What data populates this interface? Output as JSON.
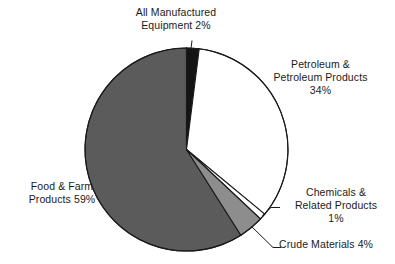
{
  "chart_data": {
    "type": "pie",
    "title": "",
    "subtitle": "",
    "xlabel": "",
    "ylabel": "",
    "legend_position": "none",
    "grid": false,
    "start_angle_deg": -90,
    "direction": "clockwise",
    "categories": [
      "All Manufactured Equipment",
      "Petroleum & Petroleum Products",
      "Chemicals & Related Products",
      "Crude Materials",
      "Food & Farm Products"
    ],
    "values": [
      2,
      34,
      1,
      4,
      59
    ],
    "units": "percent",
    "slices": [
      {
        "name": "All Manufactured Equipment",
        "value": 2,
        "value_label": "2%",
        "color": "#141414",
        "label_text": "All Manufactured\nEquipment 2%",
        "label_placement": "outside-top",
        "leader_line": true
      },
      {
        "name": "Petroleum & Petroleum Products",
        "value": 34,
        "value_label": "34%",
        "color": "#ffffff",
        "label_text": "Petroleum &\nPetroleum Products\n34%",
        "label_placement": "outside-right",
        "leader_line": false
      },
      {
        "name": "Chemicals & Related Products",
        "value": 1,
        "value_label": "1%",
        "color": "#ffffff",
        "label_text": "Chemicals &\nRelated Products\n1%",
        "label_placement": "outside-right-lower",
        "leader_line": true
      },
      {
        "name": "Crude Materials",
        "value": 4,
        "value_label": "4%",
        "color": "#8d8d8d",
        "label_text": "Crude Materials 4%",
        "label_placement": "outside-bottom-right",
        "leader_line": true
      },
      {
        "name": "Food & Farm Products",
        "value": 59,
        "value_label": "59%",
        "color": "#5b5b5b",
        "label_text": "Food & Farm\nProducts 59%",
        "label_placement": "outside-left",
        "leader_line": false
      }
    ],
    "colors": {
      "manufactured": "#141414",
      "petroleum": "#ffffff",
      "chemicals": "#ffffff",
      "crude": "#8d8d8d",
      "food_farm": "#5b5b5b",
      "outline": "#1a1a1a",
      "background": "#ffffff",
      "text": "#1a1a1a"
    }
  },
  "labels": {
    "manufactured": "All Manufactured\nEquipment 2%",
    "petroleum": "Petroleum &\nPetroleum Products\n34%",
    "chemicals": "Chemicals &\nRelated Products\n1%",
    "crude": "Crude Materials 4%",
    "food_farm": "Food & Farm\nProducts 59%"
  }
}
